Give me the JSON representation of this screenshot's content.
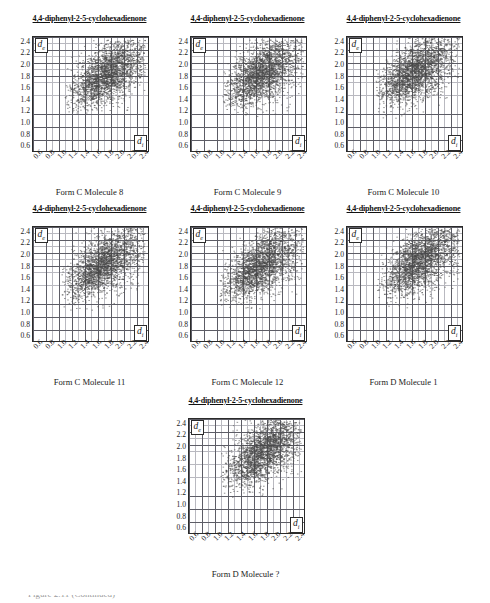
{
  "figure": {
    "axis_labels": {
      "y": "d",
      "y_sub": "e",
      "x": "d",
      "x_sub": "i"
    },
    "y_ticks": [
      "2.4",
      "2.2",
      "2.0",
      "1.8",
      "1.6",
      "1.4",
      "1.2",
      "1.0",
      "0.8",
      "0.6"
    ],
    "x_ticks": [
      "0.6",
      "0.8",
      "1.0",
      "1.2",
      "1.4",
      "1.6",
      "1.8",
      "2.0",
      "2.2",
      "2.4"
    ],
    "footer_cropped_text": "Figure 2.11  (Continued)"
  },
  "panels": [
    {
      "title": "4,4-diphenyl-2-5-cyclohexadienone",
      "caption": "Form C Molecule 8"
    },
    {
      "title": "4,4-diphenyl-2-5-cyclohexadienone",
      "caption": "Form C Molecule 9"
    },
    {
      "title": "4,4-diphenyl-2-5-cyclohexadienone",
      "caption": "Form C Molecule 10"
    },
    {
      "title": "4,4-diphenyl-2-5-cyclohexadienone",
      "caption": "Form C Molecule 11"
    },
    {
      "title": "4,4-diphenyl-2-5-cyclohexadienone",
      "caption": "Form C Molecule 12"
    },
    {
      "title": "4,4-diphenyl-2-5-cyclohexadienone",
      "caption": "Form D Molecule 1"
    },
    {
      "title": "4,4-diphenyl-2-5-cyclohexadienone",
      "caption": "Form D Molecule ?"
    }
  ],
  "chart_data": {
    "type": "scatter",
    "xlabel": "d_i",
    "ylabel": "d_e",
    "xlim": [
      0.5,
      2.5
    ],
    "ylim": [
      0.5,
      2.5
    ],
    "xticks": [
      0.6,
      0.8,
      1.0,
      1.2,
      1.4,
      1.6,
      1.8,
      2.0,
      2.2,
      2.4
    ],
    "yticks": [
      0.6,
      0.8,
      1.0,
      1.2,
      1.4,
      1.6,
      1.8,
      2.0,
      2.2,
      2.4
    ],
    "grid": true,
    "legend": "none",
    "point_color": "#4a4a4a",
    "panel_count": 7,
    "series": [
      {
        "name": "Form C Molecule 8",
        "x_range": [
          1.05,
          2.45
        ],
        "y_range": [
          1.15,
          2.45
        ],
        "centroid": [
          1.72,
          1.8
        ],
        "density_peak": [
          1.55,
          1.7
        ],
        "n_points": 2400
      },
      {
        "name": "Form C Molecule 9",
        "x_range": [
          1.05,
          2.45
        ],
        "y_range": [
          1.1,
          2.45
        ],
        "centroid": [
          1.7,
          1.78
        ],
        "density_peak": [
          1.5,
          1.72
        ],
        "n_points": 2400
      },
      {
        "name": "Form C Molecule 10",
        "x_range": [
          1.0,
          2.45
        ],
        "y_range": [
          1.05,
          2.48
        ],
        "centroid": [
          1.68,
          1.8
        ],
        "density_peak": [
          1.45,
          1.75
        ],
        "n_points": 2400
      },
      {
        "name": "Form C Molecule 11",
        "x_range": [
          1.0,
          2.45
        ],
        "y_range": [
          1.0,
          2.48
        ],
        "centroid": [
          1.7,
          1.78
        ],
        "density_peak": [
          1.5,
          1.7
        ],
        "n_points": 2400
      },
      {
        "name": "Form C Molecule 12",
        "x_range": [
          1.0,
          2.45
        ],
        "y_range": [
          1.05,
          2.48
        ],
        "centroid": [
          1.68,
          1.76
        ],
        "density_peak": [
          1.48,
          1.68
        ],
        "n_points": 2400
      },
      {
        "name": "Form D Molecule 1",
        "x_range": [
          1.0,
          2.45
        ],
        "y_range": [
          1.05,
          2.48
        ],
        "centroid": [
          1.7,
          1.8
        ],
        "density_peak": [
          1.52,
          1.74
        ],
        "n_points": 2400
      },
      {
        "name": "Form D Molecule ?",
        "x_range": [
          1.05,
          2.45
        ],
        "y_range": [
          1.1,
          2.48
        ],
        "centroid": [
          1.72,
          1.82
        ],
        "density_peak": [
          1.55,
          1.78
        ],
        "n_points": 2400
      }
    ]
  }
}
